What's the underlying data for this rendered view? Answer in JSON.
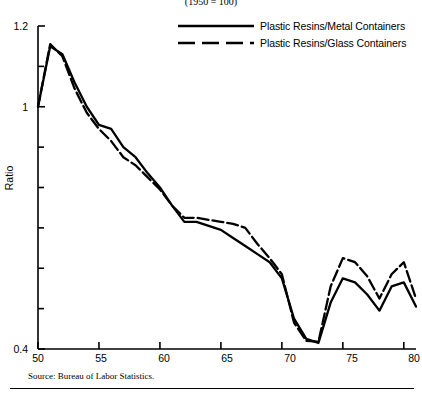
{
  "chart": {
    "title": "(1950 = 100)",
    "ylabel": "Ratio",
    "source": "Source: Bureau of Labor Statistics."
  },
  "legend": [
    {
      "label": "Plastic Resins/Metal Containers",
      "style": "solid"
    },
    {
      "label": "Plastic Resins/Glass Containers",
      "style": "dashed"
    }
  ],
  "axis": {
    "y": {
      "labels": [
        "1.2",
        "1",
        "0.4"
      ]
    },
    "x": {
      "labels": [
        "50",
        "55",
        "60",
        "65",
        "70",
        "75",
        "80"
      ]
    }
  },
  "chart_data": {
    "type": "line",
    "title": "(1950 = 100)",
    "xlabel": "",
    "ylabel": "Ratio",
    "xlim": [
      50,
      81
    ],
    "ylim": [
      0.4,
      1.2
    ],
    "yticks": [
      0.4,
      0.5,
      0.6,
      0.7,
      0.8,
      0.9,
      1.0,
      1.1,
      1.2
    ],
    "ytick_labels": {
      "0.4": "0.4",
      "1.0": "1",
      "1.2": "1.2"
    },
    "xticks": [
      50,
      55,
      60,
      65,
      70,
      75,
      80
    ],
    "grid": false,
    "legend_position": "top-right",
    "x": [
      50,
      51,
      52,
      53,
      54,
      55,
      56,
      57,
      58,
      59,
      60,
      61,
      62,
      63,
      64,
      65,
      66,
      67,
      68,
      69,
      70,
      71,
      72,
      73,
      74,
      75,
      76,
      77,
      78,
      79,
      80,
      81
    ],
    "series": [
      {
        "name": "Plastic Resins/Metal Containers",
        "style": "solid",
        "values": [
          1.0,
          1.15,
          1.13,
          1.06,
          1.0,
          0.955,
          0.945,
          0.9,
          0.875,
          0.835,
          0.8,
          0.755,
          0.715,
          0.715,
          0.705,
          0.695,
          0.675,
          0.655,
          0.635,
          0.615,
          0.575,
          0.475,
          0.425,
          0.415,
          0.515,
          0.575,
          0.565,
          0.535,
          0.495,
          0.555,
          0.565,
          0.505
        ]
      },
      {
        "name": "Plastic Resins/Glass Containers",
        "style": "dashed",
        "values": [
          1.0,
          1.155,
          1.125,
          1.045,
          0.985,
          0.945,
          0.915,
          0.875,
          0.855,
          0.825,
          0.795,
          0.755,
          0.725,
          0.725,
          0.72,
          0.715,
          0.71,
          0.7,
          0.66,
          0.625,
          0.585,
          0.465,
          0.42,
          0.418,
          0.555,
          0.625,
          0.615,
          0.58,
          0.525,
          0.585,
          0.615,
          0.525
        ]
      }
    ]
  }
}
